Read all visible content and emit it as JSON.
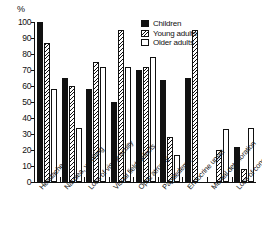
{
  "chart_data": {
    "type": "bar",
    "title": "",
    "xlabel": "",
    "ylabel": "%",
    "ylim": [
      0,
      100
    ],
    "yticks": [
      0,
      10,
      20,
      30,
      40,
      50,
      60,
      70,
      80,
      90,
      100
    ],
    "ytick_labels": [
      "0",
      "10",
      "20",
      "30",
      "40",
      "50",
      "60",
      "70",
      "80",
      "90",
      "100"
    ],
    "grid": false,
    "legend_position": "top-right",
    "categories": [
      "Headache",
      "Nausea, vomiting",
      "Loss of visual acuity",
      "Visual field defects",
      "Optic atrophy",
      "Papilledema",
      "Endocrine upset",
      "Mental deterioration",
      "Loss of consciousness"
    ],
    "series": [
      {
        "name": "Children",
        "fill": "solid-black",
        "values": [
          100,
          65,
          58,
          50,
          70,
          64,
          65,
          0,
          22
        ]
      },
      {
        "name": "Young adults",
        "fill": "hatched",
        "values": [
          87,
          60,
          75,
          95,
          72,
          28,
          95,
          20,
          8
        ]
      },
      {
        "name": "Older adults",
        "fill": "white-open",
        "values": [
          58,
          34,
          72,
          72,
          78,
          17,
          0,
          33,
          34
        ]
      }
    ]
  },
  "legend": {
    "items": [
      {
        "label": "Children"
      },
      {
        "label": "Young adults"
      },
      {
        "label": "Older adults"
      }
    ]
  },
  "axis": {
    "y_unit": "%"
  },
  "colors": {
    "ink": "#111111",
    "paper": "#ffffff"
  }
}
